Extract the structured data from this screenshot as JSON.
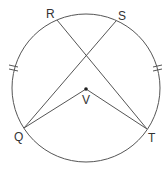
{
  "diagram": {
    "type": "circle-geometry",
    "circle": {
      "cx": 86,
      "cy": 88,
      "r": 74
    },
    "points": {
      "R": {
        "label": "R",
        "x": 57,
        "y": 20
      },
      "S": {
        "label": "S",
        "x": 116,
        "y": 21
      },
      "Q": {
        "label": "Q",
        "x": 24,
        "y": 128
      },
      "T": {
        "label": "T",
        "x": 147,
        "y": 129
      },
      "V": {
        "label": "V",
        "x": 86,
        "y": 89
      }
    },
    "segments": [
      "RT",
      "SQ",
      "QV",
      "VT"
    ],
    "congruent_arc_marks": [
      "arc RQ",
      "arc ST"
    ],
    "colors": {
      "stroke": "#555555",
      "text": "#333333",
      "background": "#ffffff"
    }
  }
}
